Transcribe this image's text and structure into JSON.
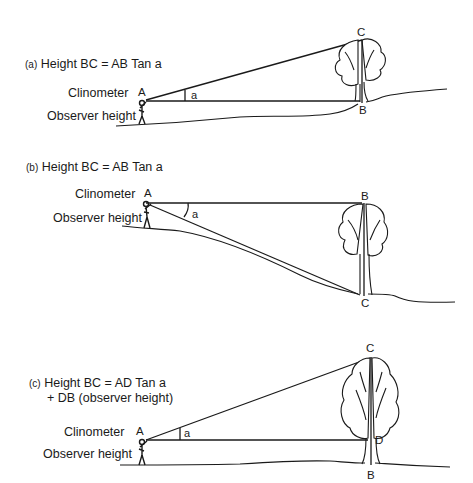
{
  "panels": [
    {
      "id": "a",
      "tag": "(a)",
      "formula": "Height BC = AB Tan a",
      "formula_line2": "",
      "clinometer_label": "Clinometer",
      "observer_label": "Observer height",
      "points": {
        "A": "A",
        "B": "B",
        "C": "C"
      },
      "angle": "a"
    },
    {
      "id": "b",
      "tag": "(b)",
      "formula": "Height BC = AB Tan a",
      "formula_line2": "",
      "clinometer_label": "Clinometer",
      "observer_label": "Observer height",
      "points": {
        "A": "A",
        "B": "B",
        "C": "C"
      },
      "angle": "a"
    },
    {
      "id": "c",
      "tag": "(c)",
      "formula": "Height BC = AD Tan a",
      "formula_line2": "+ DB (observer   height)",
      "clinometer_label": "Clinometer",
      "observer_label": "Observer height",
      "points": {
        "A": "A",
        "B": "B",
        "C": "C",
        "D": "D"
      },
      "angle": "a"
    }
  ]
}
